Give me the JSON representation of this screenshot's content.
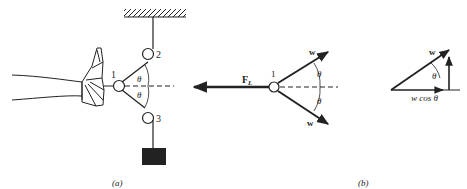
{
  "figure": {
    "panel_a": {
      "caption": "(a)",
      "pulley_labels": [
        "1",
        "2",
        "3"
      ],
      "angle_upper": "θ",
      "angle_lower": "θ"
    },
    "panel_b": {
      "caption": "(b)",
      "force_label": "F",
      "force_subscript": "L",
      "node_label": "1",
      "tension_upper": "w",
      "tension_lower": "w",
      "angle_upper": "θ",
      "angle_lower": "θ",
      "component_tension": "w",
      "component_angle": "θ",
      "component_label": "w cos θ"
    },
    "colors": {
      "ink": "#222222",
      "background": "#ffffff"
    }
  }
}
